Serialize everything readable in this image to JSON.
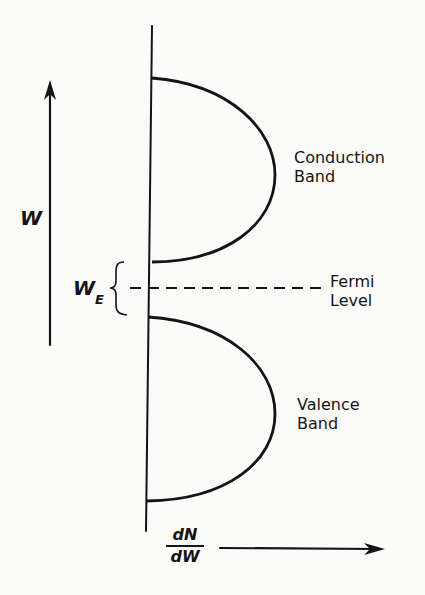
{
  "diagram": {
    "vertical_axis_label": "W",
    "fermi_energy_label": {
      "main": "W",
      "subscript": "E"
    },
    "horizontal_axis_label": {
      "numerator": "dN",
      "denominator": "dW"
    },
    "bands": [
      {
        "name": "conduction",
        "label_line1": "Conduction",
        "label_line2": "Band"
      },
      {
        "name": "valence",
        "label_line1": "Valence",
        "label_line2": "Band"
      }
    ],
    "fermi_level": {
      "label_line1": "Fermi",
      "label_line2": "Level"
    },
    "line_color": "#141414"
  }
}
